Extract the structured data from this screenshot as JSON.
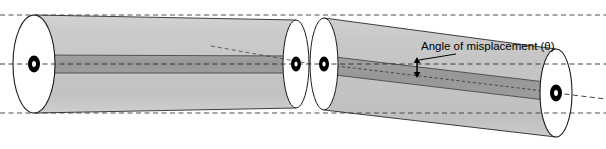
{
  "figure": {
    "type": "technical-illustration",
    "background_color": "#ffffff"
  },
  "annotations": {
    "angle_label": "Angle of misplacement (θ)",
    "angle_symbol": "θ"
  },
  "colors": {
    "cladding_fill": "#c9c9c9",
    "cladding_fill_second": "#c4c4c4",
    "core_fill": "#9b9b9b",
    "endface_fill": "#ffffff",
    "core_dot_fill": "#000000",
    "outline_stroke": "#1a1a1a",
    "dashed_axis_stroke": "#333333",
    "leader_stroke": "#000000",
    "text_color": "#000000"
  },
  "geometry": {
    "canvas_width": 606,
    "canvas_height": 149,
    "axis_y": 64,
    "top_dash_y": 15,
    "bottom_dash_y": 113,
    "fiber1": {
      "left_endface_cx": 34,
      "left_endface_cy": 64,
      "left_endface_rx": 21,
      "left_endface_ry": 49,
      "right_endface_cx": 296,
      "right_endface_cy": 64,
      "right_endface_rx": 13,
      "right_endface_ry": 44,
      "core_half_height": 9
    },
    "fiber2": {
      "left_endface_cx": 324,
      "left_endface_cy": 64,
      "left_endface_rx": 14,
      "left_endface_ry": 46,
      "right_endface_cx": 556,
      "right_endface_cy": 93,
      "right_endface_rx": 16,
      "right_endface_ry": 44,
      "tilt_degrees": 7,
      "core_half_height": 9
    },
    "core_dots": [
      {
        "cx": 34,
        "cy": 64,
        "rx": 6,
        "ry": 8,
        "hole_rx": 2,
        "hole_ry": 3
      },
      {
        "cx": 296,
        "cy": 64,
        "rx": 5,
        "ry": 7,
        "hole_rx": 1.6,
        "hole_ry": 2.6
      },
      {
        "cx": 324,
        "cy": 64,
        "rx": 5,
        "ry": 7,
        "hole_rx": 1.6,
        "hole_ry": 2.6
      },
      {
        "cx": 556,
        "cy": 93,
        "rx": 6,
        "ry": 8,
        "hole_rx": 2,
        "hole_ry": 3
      }
    ],
    "angle_arrow": {
      "x": 417,
      "y_top": 58,
      "y_bottom": 77
    },
    "label_position": {
      "x": 421,
      "y": 51
    },
    "leader_line": {
      "x1": 418,
      "y1": 61,
      "x2": 452,
      "y2": 53
    },
    "projection_line": {
      "x1": 211,
      "y1": 46,
      "x2": 310,
      "y2": 64
    }
  }
}
